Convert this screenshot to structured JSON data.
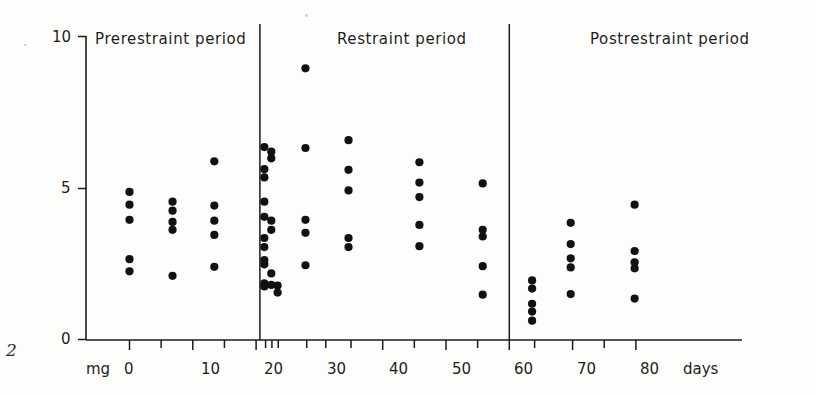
{
  "figure": {
    "number_label": "2",
    "background_color": "#fdfdfb",
    "ink_color": "#111111"
  },
  "periods": [
    {
      "name": "prerestraint",
      "label": "Prerestraint period",
      "x_start": 0,
      "x_end": 20.5,
      "title_x": 95,
      "title_y": 40
    },
    {
      "name": "restraint",
      "label": "Restraint period",
      "x_start": 20.5,
      "x_end": 60,
      "title_x": 337,
      "title_y": 40
    },
    {
      "name": "postrestraint",
      "label": "Postrestraint period",
      "x_start": 60,
      "x_end": 85,
      "title_x": 590,
      "title_y": 40
    }
  ],
  "dividers": [
    20.6,
    60.0
  ],
  "chart_data": {
    "type": "scatter",
    "title": "",
    "xlabel": "days",
    "ylabel": "mg",
    "xlim": [
      -2.5,
      85
    ],
    "ylim": [
      0,
      10
    ],
    "grid": false,
    "legend": "none",
    "x_ticks": [
      0,
      5,
      10,
      15,
      20,
      21.5,
      22.5,
      23.5,
      28,
      31,
      35,
      40,
      45,
      50,
      55,
      60,
      64,
      70,
      75,
      80
    ],
    "x_tick_labels": [
      {
        "value": 0,
        "text": "0"
      },
      {
        "value": 10,
        "text": "10"
      },
      {
        "value": 20,
        "text": "20"
      },
      {
        "value": 30,
        "text": "30"
      },
      {
        "value": 40,
        "text": "40"
      },
      {
        "value": 50,
        "text": "50"
      },
      {
        "value": 60,
        "text": "60"
      },
      {
        "value": 70,
        "text": "70"
      },
      {
        "value": 80,
        "text": "80"
      }
    ],
    "y_ticks": [
      0,
      5,
      10
    ],
    "y_tick_labels": [
      "0",
      "5",
      "10"
    ],
    "x_axis_unit_text": "days",
    "y_axis_unit_text": "mg",
    "series": [
      {
        "name": "individual-measurements",
        "marker": "filled-circle",
        "points": [
          {
            "x": 0,
            "y": 4.87
          },
          {
            "x": 0,
            "y": 4.45
          },
          {
            "x": 0,
            "y": 3.95
          },
          {
            "x": 0,
            "y": 2.65
          },
          {
            "x": 0,
            "y": 2.25
          },
          {
            "x": 6.8,
            "y": 4.55
          },
          {
            "x": 6.8,
            "y": 4.25
          },
          {
            "x": 6.8,
            "y": 3.88
          },
          {
            "x": 6.8,
            "y": 3.62
          },
          {
            "x": 6.8,
            "y": 2.1
          },
          {
            "x": 13.4,
            "y": 5.88
          },
          {
            "x": 13.4,
            "y": 4.42
          },
          {
            "x": 13.4,
            "y": 3.92
          },
          {
            "x": 13.4,
            "y": 3.45
          },
          {
            "x": 13.4,
            "y": 2.4
          },
          {
            "x": 21.3,
            "y": 6.35
          },
          {
            "x": 21.3,
            "y": 5.62
          },
          {
            "x": 21.3,
            "y": 5.35
          },
          {
            "x": 21.3,
            "y": 4.55
          },
          {
            "x": 21.3,
            "y": 4.05
          },
          {
            "x": 21.3,
            "y": 3.35
          },
          {
            "x": 21.3,
            "y": 3.05
          },
          {
            "x": 21.3,
            "y": 2.62
          },
          {
            "x": 21.3,
            "y": 2.48
          },
          {
            "x": 21.3,
            "y": 1.85
          },
          {
            "x": 21.3,
            "y": 1.75
          },
          {
            "x": 22.4,
            "y": 6.2
          },
          {
            "x": 22.4,
            "y": 5.98
          },
          {
            "x": 22.4,
            "y": 3.92
          },
          {
            "x": 22.4,
            "y": 3.62
          },
          {
            "x": 22.4,
            "y": 2.18
          },
          {
            "x": 22.4,
            "y": 1.8
          },
          {
            "x": 23.4,
            "y": 1.78
          },
          {
            "x": 23.4,
            "y": 1.55
          },
          {
            "x": 27.8,
            "y": 8.95
          },
          {
            "x": 27.8,
            "y": 6.32
          },
          {
            "x": 27.8,
            "y": 3.95
          },
          {
            "x": 27.8,
            "y": 3.52
          },
          {
            "x": 27.8,
            "y": 2.45
          },
          {
            "x": 34.6,
            "y": 6.58
          },
          {
            "x": 34.6,
            "y": 5.6
          },
          {
            "x": 34.6,
            "y": 4.92
          },
          {
            "x": 34.6,
            "y": 3.35
          },
          {
            "x": 34.6,
            "y": 3.05
          },
          {
            "x": 45.8,
            "y": 5.85
          },
          {
            "x": 45.8,
            "y": 5.18
          },
          {
            "x": 45.8,
            "y": 4.7
          },
          {
            "x": 45.8,
            "y": 3.78
          },
          {
            "x": 45.8,
            "y": 3.08
          },
          {
            "x": 55.8,
            "y": 5.15
          },
          {
            "x": 55.8,
            "y": 3.62
          },
          {
            "x": 55.8,
            "y": 3.4
          },
          {
            "x": 55.8,
            "y": 2.42
          },
          {
            "x": 55.8,
            "y": 1.48
          },
          {
            "x": 63.6,
            "y": 1.95
          },
          {
            "x": 63.6,
            "y": 1.68
          },
          {
            "x": 63.6,
            "y": 1.18
          },
          {
            "x": 63.6,
            "y": 0.92
          },
          {
            "x": 63.6,
            "y": 0.62
          },
          {
            "x": 69.7,
            "y": 3.85
          },
          {
            "x": 69.7,
            "y": 3.15
          },
          {
            "x": 69.7,
            "y": 2.68
          },
          {
            "x": 69.7,
            "y": 2.38
          },
          {
            "x": 69.7,
            "y": 1.5
          },
          {
            "x": 79.8,
            "y": 4.45
          },
          {
            "x": 79.8,
            "y": 2.92
          },
          {
            "x": 79.8,
            "y": 2.55
          },
          {
            "x": 79.8,
            "y": 2.35
          },
          {
            "x": 79.8,
            "y": 1.35
          }
        ]
      }
    ]
  }
}
